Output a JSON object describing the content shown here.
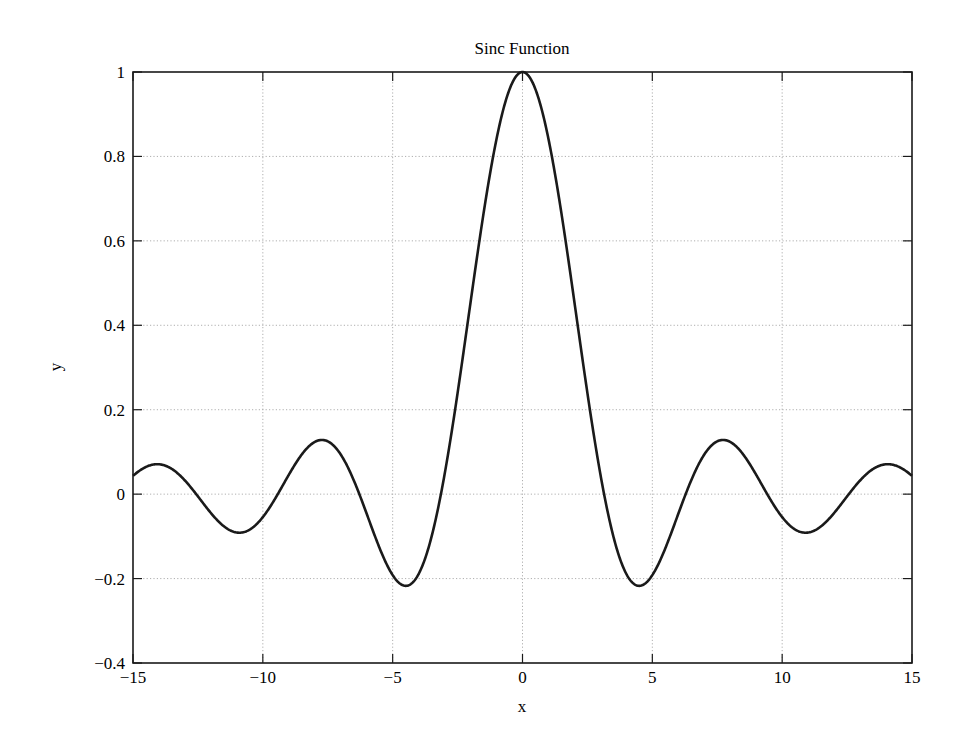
{
  "chart_data": {
    "type": "line",
    "title": "Sinc Function",
    "xlabel": "x",
    "ylabel": "y",
    "xlim": [
      -15,
      15
    ],
    "ylim": [
      -0.4,
      1
    ],
    "xticks": [
      -15,
      -10,
      -5,
      0,
      5,
      10,
      15
    ],
    "xtick_labels": [
      "−15",
      "−10",
      "−5",
      "0",
      "5",
      "10",
      "15"
    ],
    "yticks": [
      -0.4,
      -0.2,
      0,
      0.2,
      0.4,
      0.6,
      0.8,
      1
    ],
    "ytick_labels": [
      "−0.4",
      "−0.2",
      "0",
      "0.2",
      "0.4",
      "0.6",
      "0.8",
      "1"
    ],
    "grid": true,
    "legend": null,
    "series": [
      {
        "name": "sin(x)/x",
        "function": "sin(x)/x",
        "x_range": [
          -15,
          15
        ],
        "color": "#1a1a1a",
        "key_points": [
          {
            "x": -15,
            "y": 0.043
          },
          {
            "x": -14.07,
            "y": 0.071
          },
          {
            "x": -10.9,
            "y": -0.091
          },
          {
            "x": -7.73,
            "y": 0.128
          },
          {
            "x": -4.49,
            "y": -0.217
          },
          {
            "x": 0,
            "y": 1.0
          },
          {
            "x": 4.49,
            "y": -0.217
          },
          {
            "x": 7.73,
            "y": 0.128
          },
          {
            "x": 10.9,
            "y": -0.091
          },
          {
            "x": 14.07,
            "y": 0.071
          },
          {
            "x": 15,
            "y": 0.043
          }
        ]
      }
    ]
  },
  "layout": {
    "plot_left": 133,
    "plot_right": 912,
    "plot_top": 72,
    "plot_bottom": 663
  }
}
